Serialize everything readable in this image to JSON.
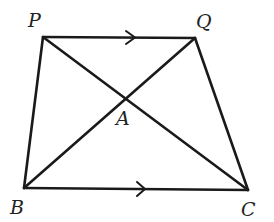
{
  "diagram": {
    "type": "trapezium",
    "points": {
      "P": {
        "label": "P",
        "x": 43,
        "y": 37
      },
      "Q": {
        "label": "Q",
        "x": 195,
        "y": 38
      },
      "B": {
        "label": "B",
        "x": 24,
        "y": 188
      },
      "C": {
        "label": "C",
        "x": 248,
        "y": 190
      },
      "A": {
        "label": "A",
        "x": 125,
        "y": 97
      }
    },
    "segments": [
      "PQ",
      "QC",
      "CB",
      "BP",
      "PC",
      "QB"
    ],
    "parallel_marks": [
      "PQ",
      "BC"
    ],
    "intersection": "A"
  }
}
